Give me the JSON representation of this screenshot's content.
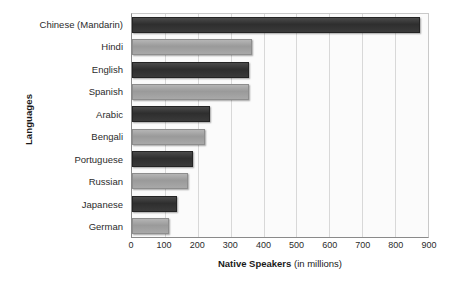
{
  "chart_data": {
    "type": "bar",
    "orientation": "horizontal",
    "title": "",
    "xlabel": "Native Speakers (in millions)",
    "xlabel_bold_part": "Native Speakers",
    "xlabel_regular_part": " (in millions)",
    "ylabel": "Languages",
    "categories": [
      "Chinese (Mandarin)",
      "Hindi",
      "English",
      "Spanish",
      "Arabic",
      "Bengali",
      "Portuguese",
      "Russian",
      "Japanese",
      "German"
    ],
    "values": [
      870,
      360,
      350,
      350,
      230,
      215,
      180,
      165,
      130,
      105
    ],
    "xlim": [
      0,
      900
    ],
    "xticks": [
      0,
      100,
      200,
      300,
      400,
      500,
      600,
      700,
      800,
      900
    ],
    "xtick_labels": [
      "0",
      "100",
      "200",
      "300",
      "400",
      "500",
      "600",
      "700",
      "800",
      "900"
    ],
    "grid": "vertical",
    "legend": "none",
    "bar_shades": [
      "dark",
      "light",
      "dark",
      "light",
      "dark",
      "light",
      "dark",
      "light",
      "dark",
      "light"
    ],
    "colors": {
      "bar_dark": "#333333",
      "bar_light": "#a0a0a0",
      "plot_background": "#fbfbfb",
      "gridline": "#d8d8d8",
      "axis": "#8a8a8a",
      "text": "#2b2b2b"
    }
  }
}
